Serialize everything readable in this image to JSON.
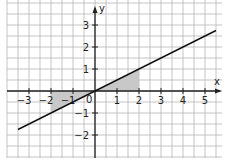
{
  "chart_data": {
    "type": "line",
    "title": "",
    "xlabel": "x",
    "ylabel": "y",
    "xlim": [
      -4,
      5.75
    ],
    "ylim": [
      -3,
      4
    ],
    "grid": true,
    "grid_step": 0.5,
    "x_ticks": [
      -3,
      -2,
      -1,
      1,
      2,
      3,
      4,
      5
    ],
    "y_ticks": [
      3,
      2,
      1,
      -1,
      -2
    ],
    "origin_label": "0",
    "series": [
      {
        "name": "y = 0.5x",
        "x": [
          -3.5,
          5.5
        ],
        "y": [
          -1.75,
          2.75
        ],
        "color": "#111111"
      }
    ],
    "shaded_regions": [
      {
        "points": [
          [
            -2,
            0
          ],
          [
            0,
            0
          ],
          [
            -2,
            -1
          ]
        ],
        "color": "#c8c8c8"
      },
      {
        "points": [
          [
            0,
            0
          ],
          [
            2,
            0
          ],
          [
            2,
            1
          ]
        ],
        "color": "#c8c8c8"
      }
    ]
  },
  "colors": {
    "grid": "#b5b5b5",
    "axis": "#222222",
    "line": "#111111",
    "shade": "#c8c8c8"
  }
}
